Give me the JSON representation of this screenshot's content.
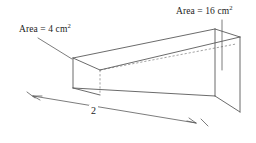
{
  "figure": {
    "background_color": "#ffffff",
    "line_color": "#5a5a5a",
    "hidden_line_color": "#8a8a8a",
    "text_color": "#1c1c1c",
    "labels": {
      "small_area": {
        "prefix": "Area = 4 cm",
        "exponent": "2",
        "full_text": "Area = 4 cm2",
        "value": 4,
        "unit": "cm^2",
        "target": "left-end-face"
      },
      "large_area": {
        "prefix": "Area = 16 cm",
        "exponent": "2",
        "full_text": "Area = 16 cm2",
        "value": 16,
        "unit": "cm^2",
        "target": "right-end-face"
      },
      "length": {
        "text": "2",
        "value": 2,
        "target": "bottom-front-edge"
      }
    },
    "geometry": {
      "front_face_outline": "73,58 215,29 215,96 73,88",
      "top_face_outline": "73,58 215,29 240,37 100,70",
      "right_end_face_outline": "215,29 240,37 240,112 215,96",
      "left_end_face_outline": "73,58 100,70 100,96 73,88",
      "hidden_edges": [
        "M 100,70 L 240,43",
        "M 100,70 L 100,96",
        "M 100,96 L 73,88"
      ],
      "visible_edges": [
        "M 73,58 L 215,29",
        "M 215,29 L 240,37",
        "M 240,37 L 240,112",
        "M 240,112 L 215,96",
        "M 215,96 L 73,88",
        "M 73,88 L 73,58",
        "M 215,29 L 215,96",
        "M 73,58 L 100,70",
        "M 100,70 L 240,37"
      ],
      "leader_small_area": "M 37,38 L 72,59",
      "leader_large_area": "M 222,21 L 222,68",
      "dimension_line": "M 33,95 L 195,122",
      "dimension_extension_left": "M 28,93 L 40,99",
      "dimension_extension_right": "M 188,118 L 200,125"
    }
  }
}
